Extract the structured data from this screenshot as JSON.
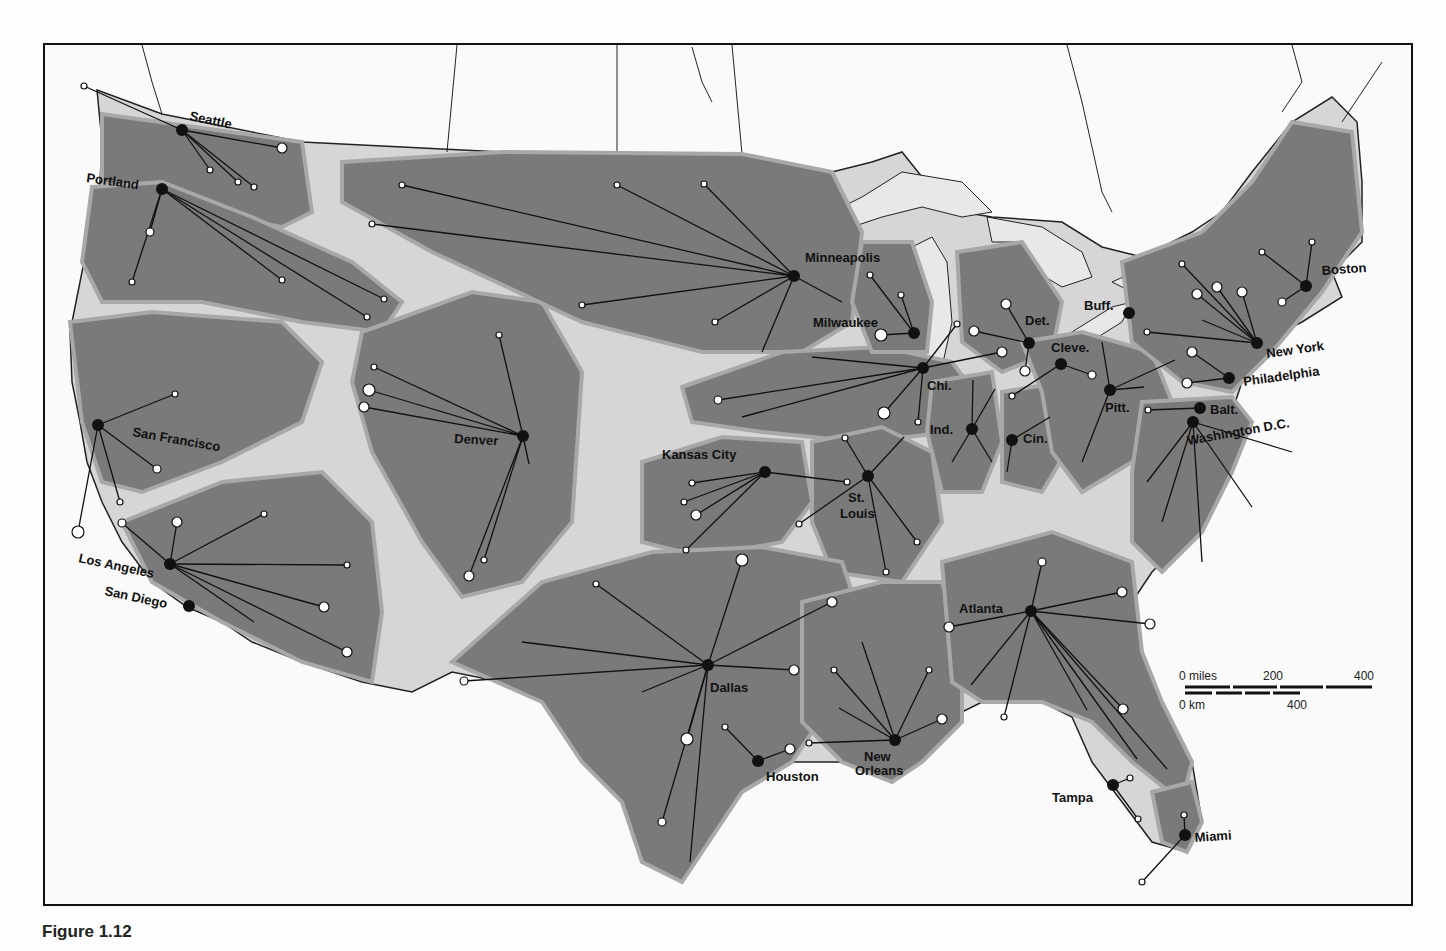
{
  "figure": {
    "caption": "Figure 1.12"
  },
  "colors": {
    "region_fill": "#7a7a7a",
    "region_edge": "#a9a9a9",
    "land_gap": "#d8d8d8",
    "water": "#fafafa",
    "lines": "#111111"
  },
  "scale_bar": {
    "miles_label": "0 miles",
    "miles_mid": "200",
    "miles_end": "400",
    "km_label": "0 km",
    "km_end": "400"
  },
  "cities": [
    {
      "name": "Seattle",
      "x": 180,
      "y": 128,
      "lx": 187,
      "ly": 118,
      "rot": 12
    },
    {
      "name": "Portland",
      "x": 160,
      "y": 187,
      "lx": 84,
      "ly": 180,
      "rot": 8
    },
    {
      "name": "San Francisco",
      "x": 96,
      "y": 423,
      "lx": 130,
      "ly": 434,
      "rot": 10
    },
    {
      "name": "Los Angeles",
      "x": 168,
      "y": 562,
      "lx": 76,
      "ly": 560,
      "rot": 12
    },
    {
      "name": "San Diego",
      "x": 187,
      "y": 604,
      "lx": 102,
      "ly": 593,
      "rot": 12
    },
    {
      "name": "Denver",
      "x": 521,
      "y": 434,
      "lx": 452,
      "ly": 441,
      "rot": 3
    },
    {
      "name": "Minneapolis",
      "x": 792,
      "y": 274,
      "lx": 803,
      "ly": 260,
      "rot": 0
    },
    {
      "name": "Milwaukee",
      "x": 912,
      "y": 331,
      "lx": 811,
      "ly": 325,
      "rot": 0
    },
    {
      "name": "Chi.",
      "x": 921,
      "y": 366,
      "lx": 925,
      "ly": 388,
      "rot": 0
    },
    {
      "name": "Det.",
      "x": 1027,
      "y": 341,
      "lx": 1023,
      "ly": 323,
      "rot": 0
    },
    {
      "name": "Cleve.",
      "x": 1059,
      "y": 362,
      "lx": 1049,
      "ly": 350,
      "rot": 0
    },
    {
      "name": "Ind.",
      "x": 970,
      "y": 427,
      "lx": 928,
      "ly": 432,
      "rot": 0
    },
    {
      "name": "Cin.",
      "x": 1010,
      "y": 438,
      "lx": 1021,
      "ly": 441,
      "rot": 0
    },
    {
      "name": "Pitt.",
      "x": 1108,
      "y": 388,
      "lx": 1103,
      "ly": 410,
      "rot": 0
    },
    {
      "name": "Buff.",
      "x": 1127,
      "y": 311,
      "lx": 1082,
      "ly": 308,
      "rot": 0
    },
    {
      "name": "Boston",
      "x": 1304,
      "y": 284,
      "lx": 1320,
      "ly": 273,
      "rot": -4
    },
    {
      "name": "New York",
      "x": 1255,
      "y": 341,
      "lx": 1265,
      "ly": 356,
      "rot": -8
    },
    {
      "name": "Philadelphia",
      "x": 1227,
      "y": 376,
      "lx": 1242,
      "ly": 384,
      "rot": -8
    },
    {
      "name": "Balt.",
      "x": 1198,
      "y": 406,
      "lx": 1208,
      "ly": 412,
      "rot": 0
    },
    {
      "name": "Washington D.C.",
      "x": 1191,
      "y": 420,
      "lx": 1186,
      "ly": 443,
      "rot": -10
    },
    {
      "name": "Kansas City",
      "x": 763,
      "y": 470,
      "lx": 660,
      "ly": 457,
      "rot": 0
    },
    {
      "name": "St.",
      "x": 866,
      "y": 474,
      "lx": 846,
      "ly": 500,
      "rot": 0
    },
    {
      "name": "Louis",
      "x": null,
      "y": null,
      "lx": 838,
      "ly": 516,
      "rot": 0
    },
    {
      "name": "Dallas",
      "x": 706,
      "y": 663,
      "lx": 708,
      "ly": 690,
      "rot": 0
    },
    {
      "name": "Houston",
      "x": 756,
      "y": 759,
      "lx": 764,
      "ly": 779,
      "rot": 0
    },
    {
      "name": "New",
      "x": 893,
      "y": 738,
      "lx": 862,
      "ly": 759,
      "rot": 0
    },
    {
      "name": "Orleans",
      "x": null,
      "y": null,
      "lx": 853,
      "ly": 773,
      "rot": 0
    },
    {
      "name": "Atlanta",
      "x": 1029,
      "y": 609,
      "lx": 957,
      "ly": 611,
      "rot": 0
    },
    {
      "name": "Tampa",
      "x": 1111,
      "y": 783,
      "lx": 1050,
      "ly": 800,
      "rot": 0
    },
    {
      "name": "Miami",
      "x": 1183,
      "y": 833,
      "lx": 1193,
      "ly": 840,
      "rot": -4
    }
  ]
}
